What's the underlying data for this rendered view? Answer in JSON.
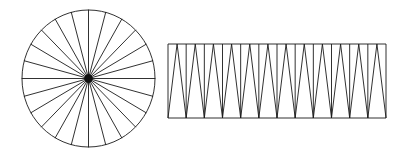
{
  "canvas": {
    "width": 404,
    "height": 163,
    "background": "#ffffff",
    "stroke_color": "#1a1a1a",
    "stroke_width": 0.9
  },
  "figure": {
    "sector_count": 24,
    "shapes": [
      {
        "name": "sectored-circle",
        "type": "circle",
        "center_x": 88.5,
        "center_y": 78.5,
        "radius_x": 66.5,
        "radius_y": 68.5,
        "sectors": 24,
        "sector_angle_deg": 15,
        "hub_radius": 4.2,
        "hub_color": "#111111"
      },
      {
        "name": "rearranged-rectangle",
        "type": "rectangle-of-sectors",
        "left": 168,
        "top": 44,
        "right": 386,
        "bottom": 118,
        "width": 218,
        "height": 74,
        "triangles_up": 12,
        "triangles_down": 12,
        "total_triangles": 24,
        "cell_width": 18.1667
      }
    ]
  }
}
